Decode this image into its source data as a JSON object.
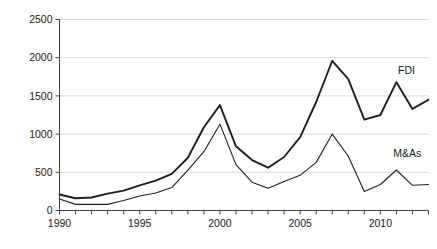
{
  "chart_data": {
    "type": "line",
    "title": "",
    "subtitle": "",
    "xlabel": "",
    "ylabel": "",
    "xlim": [
      1990,
      2013
    ],
    "ylim": [
      0,
      2500
    ],
    "yticks": [
      0,
      500,
      1000,
      1500,
      2000,
      2500
    ],
    "ytick_labels": [
      "0",
      "500",
      "1000",
      "1500",
      "2000",
      "2500"
    ],
    "xticks": [
      1990,
      1991,
      1992,
      1993,
      1994,
      1995,
      1996,
      1997,
      1998,
      1999,
      2000,
      2001,
      2002,
      2003,
      2004,
      2005,
      2006,
      2007,
      2008,
      2009,
      2010,
      2011,
      2012,
      2013
    ],
    "xtick_labels_shown": [
      "1990",
      "1995",
      "2000",
      "2005",
      "2010"
    ],
    "xtick_labels_shown_values": [
      1990,
      1995,
      2000,
      2005,
      2010
    ],
    "grid": "horizontal",
    "legend_position": "inline-right",
    "x": [
      1990,
      1991,
      1992,
      1993,
      1994,
      1995,
      1996,
      1997,
      1998,
      1999,
      2000,
      2001,
      2002,
      2003,
      2004,
      2005,
      2006,
      2007,
      2008,
      2009,
      2010,
      2011,
      2012,
      2013
    ],
    "series": [
      {
        "name": "FDI",
        "label": "FDI",
        "color": "#1f1f1f",
        "stroke_width": 1.9,
        "values": [
          210,
          160,
          170,
          220,
          260,
          330,
          390,
          480,
          690,
          1090,
          1380,
          840,
          660,
          560,
          700,
          960,
          1420,
          1960,
          1720,
          1190,
          1250,
          1680,
          1330,
          1450
        ]
      },
      {
        "name": "M&As",
        "label": "M&As",
        "color": "#1f1f1f",
        "stroke_width": 1.1,
        "values": [
          150,
          80,
          80,
          80,
          130,
          190,
          230,
          300,
          530,
          770,
          1130,
          600,
          370,
          290,
          380,
          460,
          630,
          1000,
          710,
          250,
          340,
          530,
          330,
          340
        ]
      }
    ],
    "annotations": [
      {
        "text": "FDI",
        "x": 2011.1,
        "y": 1790
      },
      {
        "text": "M&As",
        "x": 2010.8,
        "y": 700
      }
    ]
  }
}
